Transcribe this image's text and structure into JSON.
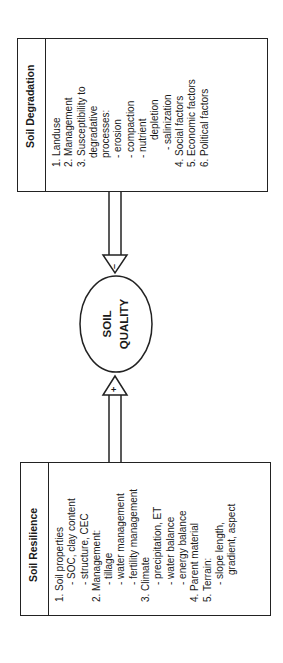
{
  "degradation": {
    "title": "Soil Degradation",
    "items": [
      {
        "text": "1. Landuse",
        "indent": 0
      },
      {
        "text": "2. Management",
        "indent": 0
      },
      {
        "text": "3. Susceptibility to",
        "indent": 0
      },
      {
        "text": "degradative",
        "indent": 1
      },
      {
        "text": "processes:",
        "indent": 1
      },
      {
        "text": "- erosion",
        "indent": 1
      },
      {
        "text": "- compaction",
        "indent": 1
      },
      {
        "text": "- nutrient",
        "indent": 1
      },
      {
        "text": "depletion",
        "indent": 3
      },
      {
        "text": "- salinization",
        "indent": 2
      },
      {
        "text": "4. Social factors",
        "indent": 0
      },
      {
        "text": "5. Economic factors",
        "indent": 0
      },
      {
        "text": "6. Political factors",
        "indent": 0
      }
    ]
  },
  "resilience": {
    "title": "Soil Resilience",
    "items": [
      {
        "text": "1. Soil properties",
        "indent": 0
      },
      {
        "text": "- SOC, clay content",
        "indent": 2
      },
      {
        "text": "- structure, CEC",
        "indent": 2
      },
      {
        "text": "2. Management:",
        "indent": 0
      },
      {
        "text": "- tillage",
        "indent": 2
      },
      {
        "text": "- water management",
        "indent": 2
      },
      {
        "text": "- fertility management",
        "indent": 2
      },
      {
        "text": "3. Climate",
        "indent": 0
      },
      {
        "text": "- precipitation, ET",
        "indent": 2
      },
      {
        "text": "- water balance",
        "indent": 2
      },
      {
        "text": "- energy balance",
        "indent": 2
      },
      {
        "text": "4. Parent material",
        "indent": 0
      },
      {
        "text": "5. Terrain:",
        "indent": 0
      },
      {
        "text": "- slope length,",
        "indent": 2
      },
      {
        "text": "gradient, aspect",
        "indent": 3
      }
    ]
  },
  "center": {
    "line1": "SOIL",
    "line2": "QUALITY"
  },
  "arrows": {
    "degradation_sign": "–",
    "resilience_sign": "+"
  }
}
